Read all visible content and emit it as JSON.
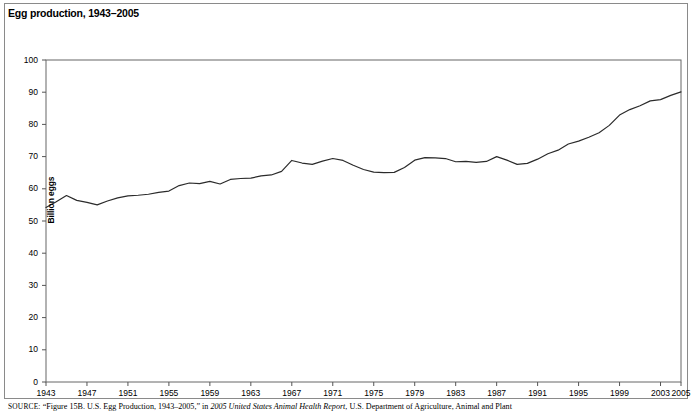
{
  "figure": {
    "title": "Egg production, 1943–2005",
    "source_label": "SOURCE:",
    "source_text_part1": "“Figure 15B. U.S. Egg Production, 1943–2005,” in ",
    "source_italic1": "2005 United States Animal Health Report",
    "source_text_part2": ", U.S. Department of Agriculture, Animal and Plant"
  },
  "chart_data": {
    "type": "line",
    "title": "Egg production, 1943–2005",
    "xlabel": "",
    "ylabel": "Billion eggs",
    "ylim": [
      0,
      100
    ],
    "xlim": [
      1943,
      2005
    ],
    "grid": false,
    "legend": "none",
    "y_ticks": [
      0,
      10,
      20,
      30,
      40,
      50,
      60,
      70,
      80,
      90,
      100
    ],
    "x_ticks": [
      1943,
      1947,
      1951,
      1955,
      1959,
      1963,
      1967,
      1971,
      1975,
      1979,
      1983,
      1987,
      1991,
      1995,
      1999,
      2003,
      2005
    ],
    "series": [
      {
        "name": "Egg production",
        "color": "#2b2b2b",
        "x": [
          1943,
          1944,
          1945,
          1946,
          1947,
          1948,
          1949,
          1950,
          1951,
          1952,
          1953,
          1954,
          1955,
          1956,
          1957,
          1958,
          1959,
          1960,
          1961,
          1962,
          1963,
          1964,
          1965,
          1966,
          1967,
          1968,
          1969,
          1970,
          1971,
          1972,
          1973,
          1974,
          1975,
          1976,
          1977,
          1978,
          1979,
          1980,
          1981,
          1982,
          1983,
          1984,
          1985,
          1986,
          1987,
          1988,
          1989,
          1990,
          1991,
          1992,
          1993,
          1994,
          1995,
          1996,
          1997,
          1998,
          1999,
          2000,
          2001,
          2002,
          2003,
          2004,
          2005
        ],
        "values": [
          54.2,
          56.0,
          57.9,
          56.4,
          55.8,
          55.0,
          56.2,
          57.2,
          57.8,
          58.0,
          58.3,
          58.9,
          59.3,
          61.0,
          61.8,
          61.6,
          62.3,
          61.5,
          62.9,
          63.2,
          63.3,
          64.0,
          64.3,
          65.4,
          68.8,
          68.0,
          67.6,
          68.6,
          69.4,
          68.8,
          67.3,
          66.0,
          65.2,
          65.0,
          65.1,
          66.6,
          68.9,
          69.7,
          69.6,
          69.4,
          68.4,
          68.5,
          68.2,
          68.5,
          70.0,
          68.9,
          67.6,
          67.9,
          69.2,
          70.9,
          72.0,
          73.9,
          74.8,
          76.0,
          77.4,
          79.7,
          82.9,
          84.6,
          85.8,
          87.3,
          87.7,
          89.0,
          90.1
        ]
      }
    ]
  }
}
